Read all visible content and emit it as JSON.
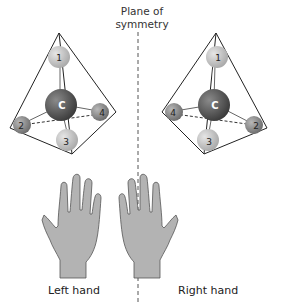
{
  "plane": {
    "label_line1": "Plane of",
    "label_line2": "symmetry"
  },
  "left": {
    "caption": "Left hand",
    "center_atom": "C",
    "atoms": [
      {
        "label": "1",
        "position": "top"
      },
      {
        "label": "2",
        "position": "left"
      },
      {
        "label": "3",
        "position": "front"
      },
      {
        "label": "4",
        "position": "right"
      }
    ]
  },
  "right": {
    "caption": "Right hand",
    "center_atom": "C",
    "atoms": [
      {
        "label": "1",
        "position": "top"
      },
      {
        "label": "4",
        "position": "left"
      },
      {
        "label": "3",
        "position": "front"
      },
      {
        "label": "2",
        "position": "right"
      }
    ]
  },
  "colors": {
    "carbon": "#5a5a5a",
    "atom_light": "#c8c8c8",
    "atom_mid": "#a0a0a0",
    "hand": "#b3b3b3",
    "line": "#222222"
  }
}
